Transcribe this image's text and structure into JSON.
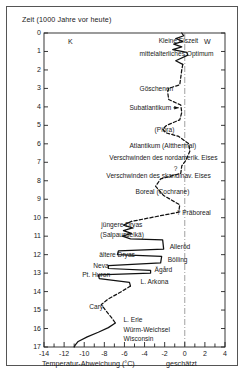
{
  "figure": {
    "y_axis_title": "Zeit (1000 Jahre vor heute)",
    "x_axis_title": "Temperatur-Abweichung (°C)",
    "x_axis_note": "geschätzt",
    "corner_left": "K",
    "corner_right": "W",
    "uncertain_marker": "?"
  },
  "chart_data": {
    "type": "line",
    "xlabel": "Temperatur-Abweichung (°C)",
    "ylabel": "Zeit (1000 Jahre vor heute)",
    "xlim": [
      -14,
      4
    ],
    "ylim": [
      0,
      17
    ],
    "y_inverted": true,
    "grid": false,
    "zero_reference_line": 0,
    "x_ticks": [
      -14,
      -13,
      -12,
      -11,
      -10,
      -9,
      -8,
      -7,
      -6,
      -5,
      -4,
      -3,
      -2,
      -1,
      0,
      1,
      2,
      3,
      4
    ],
    "x_tick_labels": [
      "-14",
      "",
      "-12",
      "",
      "-10",
      "",
      "-8",
      "",
      "-6",
      "",
      "-4",
      "",
      "-2",
      "",
      "0",
      "",
      "2",
      "",
      "4"
    ],
    "y_ticks": [
      0,
      1,
      2,
      3,
      4,
      5,
      6,
      7,
      8,
      9,
      10,
      11,
      12,
      13,
      14,
      15,
      16,
      17
    ],
    "y_tick_labels": [
      "0",
      "1",
      "2",
      "3",
      "4",
      "5",
      "6",
      "7",
      "8",
      "9",
      "10",
      "11",
      "12",
      "13",
      "14",
      "15",
      "16",
      "17"
    ],
    "legend_position": "none",
    "series": [
      {
        "name": "Temperaturabweichung (solide = belegt)",
        "style": "solid",
        "points": [
          {
            "t": 0.0,
            "dT": -0.3
          },
          {
            "t": 0.15,
            "dT": -0.1
          },
          {
            "t": 0.3,
            "dT": -0.9
          },
          {
            "t": 0.45,
            "dT": -0.2
          },
          {
            "t": 0.6,
            "dT": -1.1
          },
          {
            "t": 0.75,
            "dT": -0.3
          },
          {
            "t": 0.9,
            "dT": -1.2
          },
          {
            "t": 1.05,
            "dT": 0.2
          },
          {
            "t": 1.2,
            "dT": 0.3
          },
          {
            "t": 1.5,
            "dT": -0.9
          },
          {
            "t": 1.7,
            "dT": -0.2
          }
        ]
      },
      {
        "name": "Temperaturabweichung (gestrichelt = unsicher)",
        "style": "dashed",
        "points": [
          {
            "t": 1.7,
            "dT": -0.2
          },
          {
            "t": 2.0,
            "dT": -0.3
          },
          {
            "t": 2.4,
            "dT": -0.4
          },
          {
            "t": 2.8,
            "dT": -0.5
          },
          {
            "t": 3.0,
            "dT": -1.6
          },
          {
            "t": 3.2,
            "dT": -1.7
          },
          {
            "t": 3.6,
            "dT": -1.6
          },
          {
            "t": 3.9,
            "dT": -0.4
          },
          {
            "t": 4.3,
            "dT": -0.3
          },
          {
            "t": 4.7,
            "dT": -0.5
          },
          {
            "t": 5.0,
            "dT": -1.8
          },
          {
            "t": 5.2,
            "dT": -2.2
          },
          {
            "t": 5.4,
            "dT": -1.9
          },
          {
            "t": 5.6,
            "dT": -0.6
          },
          {
            "t": 6.0,
            "dT": 0.4
          },
          {
            "t": 6.4,
            "dT": 0.5
          },
          {
            "t": 6.9,
            "dT": 0.1
          },
          {
            "t": 7.2,
            "dT": -0.3
          },
          {
            "t": 7.6,
            "dT": -0.4
          },
          {
            "t": 7.9,
            "dT": -2.4
          },
          {
            "t": 8.3,
            "dT": -2.9
          },
          {
            "t": 8.8,
            "dT": -2.1
          },
          {
            "t": 9.3,
            "dT": -0.5
          },
          {
            "t": 9.7,
            "dT": -0.6
          },
          {
            "t": 10.2,
            "dT": -5.3
          }
        ]
      },
      {
        "name": "Spätglaziale Oszillationen",
        "style": "solid",
        "points": [
          {
            "t": 10.2,
            "dT": -5.3
          },
          {
            "t": 10.4,
            "dT": -6.1
          },
          {
            "t": 10.55,
            "dT": -5.2
          },
          {
            "t": 10.7,
            "dT": -6.1
          },
          {
            "t": 10.85,
            "dT": -5.3
          },
          {
            "t": 11.0,
            "dT": -6.2
          },
          {
            "t": 11.15,
            "dT": -5.4
          },
          {
            "t": 11.2,
            "dT": -2.2
          },
          {
            "t": 11.7,
            "dT": -2.1
          },
          {
            "t": 11.8,
            "dT": -6.6
          },
          {
            "t": 12.0,
            "dT": -6.7
          },
          {
            "t": 12.1,
            "dT": -2.3
          },
          {
            "t": 12.45,
            "dT": -2.4
          },
          {
            "t": 12.6,
            "dT": -7.6
          },
          {
            "t": 12.75,
            "dT": -7.6
          },
          {
            "t": 12.85,
            "dT": -3.4
          },
          {
            "t": 13.0,
            "dT": -3.4
          },
          {
            "t": 13.1,
            "dT": -8.6
          },
          {
            "t": 13.3,
            "dT": -8.5
          },
          {
            "t": 13.5,
            "dT": -5.5
          },
          {
            "t": 13.7,
            "dT": -5.4
          }
        ]
      },
      {
        "name": "Cary / L. Erie (unsicher)",
        "style": "dashed",
        "points": [
          {
            "t": 13.7,
            "dT": -5.4
          },
          {
            "t": 14.0,
            "dT": -6.3
          },
          {
            "t": 14.4,
            "dT": -7.6
          },
          {
            "t": 14.7,
            "dT": -8.3
          },
          {
            "t": 15.0,
            "dT": -7.9
          },
          {
            "t": 15.4,
            "dT": -7.3
          },
          {
            "t": 15.7,
            "dT": -6.9
          }
        ]
      },
      {
        "name": "Würm-Weichsel / Wisconsin Maximum",
        "style": "solid",
        "points": [
          {
            "t": 15.7,
            "dT": -6.9
          },
          {
            "t": 15.95,
            "dT": -7.6
          },
          {
            "t": 16.2,
            "dT": -8.6
          },
          {
            "t": 16.45,
            "dT": -9.7
          },
          {
            "t": 16.7,
            "dT": -10.6
          },
          {
            "t": 16.9,
            "dT": -10.9
          },
          {
            "t": 17.0,
            "dT": -11.0
          }
        ]
      }
    ],
    "annotations": [
      {
        "id": "kleine-eiszeit",
        "text": "Kleine Eiszeit",
        "t": 0.45,
        "dT": -2.6,
        "leader": false
      },
      {
        "id": "mittelalterliches-optimum",
        "text": "mittelalterliches Optimum",
        "t": 1.15,
        "dT": -4.5,
        "leader": true
      },
      {
        "id": "goeschenen",
        "text": "Göschenen",
        "t": 3.05,
        "dT": -4.5,
        "leader": false
      },
      {
        "id": "subatlantikum",
        "text": "Subatlantikum",
        "t": 4.05,
        "dT": -5.5,
        "leader": true
      },
      {
        "id": "piora",
        "text": "(Piora)",
        "t": 5.25,
        "dT": -3.0,
        "leader": false
      },
      {
        "id": "atlantikum-altthermal",
        "text": "Atlantikum (Altthermal)",
        "t": 6.1,
        "dT": -5.5,
        "leader": true
      },
      {
        "id": "verschwinden-nordamerik-eis",
        "text": "Verschwinden des nordamerik. Eises",
        "t": 6.75,
        "dT": -7.5,
        "leader": true
      },
      {
        "id": "verschwinden-skandinav-eis",
        "text": "Verschwinden des skandinav. Eises",
        "t": 7.75,
        "dT": -7.8,
        "leader": true
      },
      {
        "id": "boreal-cochrane",
        "text": "Boreal (Cochrane)",
        "t": 8.6,
        "dT": -4.9,
        "leader": false
      },
      {
        "id": "praeboreal",
        "text": "? Präboreal",
        "t": 9.75,
        "dT": -0.8,
        "leader": false
      },
      {
        "id": "juengere-dryas",
        "text": "jüngere Dryas",
        "t": 10.4,
        "dT": -8.3,
        "leader": false
      },
      {
        "id": "salpausselka",
        "text": "(Salpausselkä)",
        "t": 10.95,
        "dT": -8.4,
        "leader": false
      },
      {
        "id": "alleroed",
        "text": "Alleröd",
        "t": 11.6,
        "dT": -1.5,
        "leader": false
      },
      {
        "id": "aeltere-dryas",
        "text": "ältere Dryas",
        "t": 12.0,
        "dT": -8.5,
        "leader": false
      },
      {
        "id": "boelling",
        "text": "Bölling",
        "t": 12.3,
        "dT": -1.7,
        "leader": false
      },
      {
        "id": "neva",
        "text": "Neva",
        "t": 12.6,
        "dT": -9.1,
        "leader": false
      },
      {
        "id": "aagaard",
        "text": "Ägård",
        "t": 12.85,
        "dT": -3.0,
        "leader": false
      },
      {
        "id": "pt-huron",
        "text": "Pt. Huron",
        "t": 13.1,
        "dT": -10.2,
        "leader": false
      },
      {
        "id": "l-arkona",
        "text": "L. Arkona",
        "t": 13.5,
        "dT": -4.4,
        "leader": false
      },
      {
        "id": "cary",
        "text": "Cary",
        "t": 14.85,
        "dT": -9.5,
        "leader": false
      },
      {
        "id": "l-erie",
        "text": "L. Erie",
        "t": 15.55,
        "dT": -6.1,
        "leader": false
      },
      {
        "id": "wuerm-weichsel",
        "text": "Würm-Weichsel",
        "t": 16.1,
        "dT": -6.1,
        "leader": false
      },
      {
        "id": "wisconsin",
        "text": "Wisconsin",
        "t": 16.55,
        "dT": -6.1,
        "leader": false
      },
      {
        "id": "uncertainty-mark",
        "text": "?",
        "t": 7.35,
        "dT": -1.1,
        "leader": false
      }
    ]
  },
  "colors": {
    "line": "#111111",
    "axis": "#222222",
    "frame": "#555555",
    "reference": "#888888",
    "background": "#ffffff"
  }
}
